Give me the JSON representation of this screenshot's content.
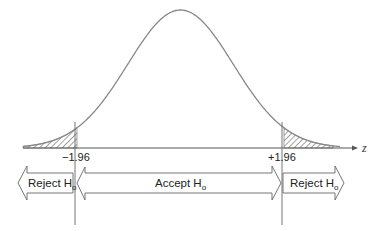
{
  "diagram": {
    "axis_label": "z",
    "critical_values": [
      -1.96,
      1.96
    ],
    "critical_labels": [
      "−1.96",
      "+1.96"
    ],
    "regions": [
      {
        "label": "Reject H",
        "subscript": "o",
        "direction": "left"
      },
      {
        "label": "Accept H",
        "subscript": "o",
        "direction": "both"
      },
      {
        "label": "Reject H",
        "subscript": "o",
        "direction": "right"
      }
    ],
    "shaded_tails": "both",
    "colors": {
      "curve": "#888888",
      "line": "#555555",
      "hatch": "#444444",
      "text": "#222222"
    }
  }
}
